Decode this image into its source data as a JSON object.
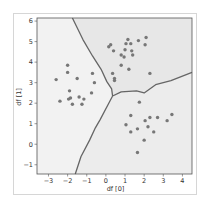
{
  "chart_data": {
    "type": "scatter",
    "title": "",
    "xlabel": "df [0]",
    "ylabel": "df [1]",
    "xlim": [
      -3.6,
      4.5
    ],
    "ylim": [
      -1.45,
      6.15
    ],
    "xticks": [
      -3,
      -2,
      -1,
      0,
      1,
      2,
      3,
      4
    ],
    "yticks": [
      -1,
      0,
      1,
      2,
      3,
      4,
      5,
      6
    ],
    "grid": false,
    "legend": null,
    "colors": {
      "region_left": "#f2f2f2",
      "region_top": "#e6e6e6",
      "region_bottom": "#ececec",
      "boundary": "#666666",
      "points": "#777777",
      "axes": "#555555"
    },
    "decision_boundaries": [
      {
        "name": "left-top",
        "points": [
          [
            -1.75,
            6.15
          ],
          [
            -1.2,
            5.1
          ],
          [
            -0.7,
            4.3
          ],
          [
            -0.25,
            3.65
          ],
          [
            0.05,
            3.05
          ],
          [
            0.3,
            2.7
          ],
          [
            0.35,
            2.35
          ]
        ]
      },
      {
        "name": "top-bottom",
        "points": [
          [
            0.35,
            2.35
          ],
          [
            0.8,
            2.55
          ],
          [
            1.6,
            2.6
          ],
          [
            2.0,
            2.5
          ],
          [
            2.6,
            2.9
          ],
          [
            3.4,
            3.1
          ],
          [
            4.5,
            3.5
          ]
        ]
      },
      {
        "name": "left-bottom",
        "points": [
          [
            0.35,
            2.35
          ],
          [
            0.15,
            2.0
          ],
          [
            -0.3,
            1.2
          ],
          [
            -0.55,
            0.8
          ],
          [
            -0.85,
            0.2
          ],
          [
            -1.3,
            -0.6
          ],
          [
            -1.6,
            -1.45
          ]
        ]
      }
    ],
    "series": [
      {
        "name": "cluster-left",
        "points": [
          [
            -2.6,
            3.15
          ],
          [
            -2.4,
            2.1
          ],
          [
            -2.0,
            3.85
          ],
          [
            -2.0,
            3.5
          ],
          [
            -1.9,
            2.6
          ],
          [
            -1.95,
            2.2
          ],
          [
            -1.85,
            2.25
          ],
          [
            -1.75,
            1.95
          ],
          [
            -1.5,
            3.2
          ],
          [
            -1.4,
            2.3
          ],
          [
            -1.25,
            1.95
          ],
          [
            -1.15,
            2.2
          ],
          [
            -0.75,
            2.5
          ],
          [
            -0.7,
            3.45
          ],
          [
            -0.6,
            3.0
          ]
        ]
      },
      {
        "name": "cluster-top",
        "points": [
          [
            0.15,
            4.75
          ],
          [
            0.25,
            4.85
          ],
          [
            0.35,
            3.45
          ],
          [
            0.4,
            4.55
          ],
          [
            0.45,
            3.2
          ],
          [
            0.45,
            3.1
          ],
          [
            0.8,
            3.85
          ],
          [
            0.8,
            4.35
          ],
          [
            0.95,
            4.25
          ],
          [
            1.0,
            4.6
          ],
          [
            1.05,
            4.9
          ],
          [
            1.15,
            5.1
          ],
          [
            1.2,
            3.65
          ],
          [
            1.3,
            4.9
          ],
          [
            1.35,
            4.55
          ],
          [
            1.4,
            4.35
          ],
          [
            1.7,
            5.05
          ],
          [
            2.05,
            4.85
          ],
          [
            2.1,
            5.2
          ],
          [
            2.3,
            3.45
          ]
        ]
      },
      {
        "name": "cluster-bottom",
        "points": [
          [
            1.05,
            0.95
          ],
          [
            1.3,
            1.4
          ],
          [
            1.3,
            0.6
          ],
          [
            1.65,
            0.75
          ],
          [
            1.65,
            -0.4
          ],
          [
            1.75,
            2.05
          ],
          [
            2.0,
            0.2
          ],
          [
            2.05,
            1.15
          ],
          [
            2.2,
            0.85
          ],
          [
            2.3,
            1.3
          ],
          [
            2.5,
            0.6
          ],
          [
            2.7,
            1.3
          ],
          [
            3.2,
            1.15
          ],
          [
            3.45,
            1.45
          ]
        ]
      }
    ]
  }
}
